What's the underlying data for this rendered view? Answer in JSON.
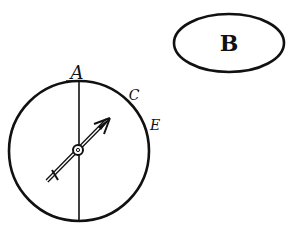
{
  "figure": {
    "ink_color": "#111111",
    "background": "#ffffff"
  },
  "labels": {
    "a": "A",
    "b": "B",
    "c": "C",
    "e": "E"
  },
  "circle": {
    "cx": 79,
    "cy": 151,
    "r": 70
  },
  "ellipse": {
    "cx": 229,
    "cy": 43,
    "rx": 56,
    "ry": 29
  },
  "needle": {
    "head": [
      110,
      118
    ],
    "tail": [
      46,
      182
    ],
    "pivot": [
      78,
      150
    ]
  }
}
